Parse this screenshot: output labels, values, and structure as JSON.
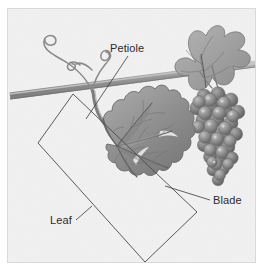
{
  "figure": {
    "style": "grayscale-botanical-illustration",
    "canvas": {
      "width": 264,
      "height": 276
    },
    "background_color": "#f2f2f2",
    "frame_color": "#d9d9d9",
    "page_color": "#ffffff"
  },
  "labels": [
    {
      "id": "petiole",
      "text": "Petiole",
      "x": 110,
      "y": 52,
      "anchor": "start",
      "leader_from": [
        128,
        56
      ],
      "leader_to": [
        86,
        119
      ]
    },
    {
      "id": "blade",
      "text": "Blade",
      "x": 213,
      "y": 204,
      "anchor": "start",
      "leader_from": [
        210,
        200
      ],
      "leader_to": [
        165,
        186
      ]
    },
    {
      "id": "leaf",
      "text": "Leaf",
      "x": 50,
      "y": 224,
      "anchor": "start",
      "leader_from": [
        76,
        220
      ],
      "leader_to": [
        90,
        208
      ]
    }
  ],
  "annotations": {
    "diamond_outline": {
      "name": "leaf-bounding-diamond",
      "points": "73,94 197,212 145,262 38,143",
      "stroke": "#4a4a4a"
    }
  },
  "parts": [
    {
      "id": "vine-stem",
      "name": "Vine stem",
      "tone": "#9a9a9a"
    },
    {
      "id": "tendril",
      "name": "Tendril",
      "tone": "#8e8e8e"
    },
    {
      "id": "petiole-stalk",
      "name": "Petiole stalk",
      "tone": "#8b8b8b"
    },
    {
      "id": "leaf-blade",
      "name": "Leaf blade",
      "tone": "#8c8c8c"
    },
    {
      "id": "upper-leaf",
      "name": "Upper leaf",
      "tone": "#9a9a9a"
    },
    {
      "id": "grape-cluster",
      "name": "Grape cluster",
      "tone": "#8a8a8a"
    }
  ],
  "colors": {
    "ink": "#2b2b2b",
    "leader": "#3a3a3a",
    "leaf_fill": "#8f8f8f",
    "leaf_dark": "#6f6f6f",
    "leaf_light": "#b6b6b6",
    "grape_fill": "#8d8d8d",
    "grape_dark": "#6a6a6a",
    "grape_light": "#c0c0c0",
    "stem_fill": "#a0a0a0",
    "background": "#f2f2f2"
  }
}
